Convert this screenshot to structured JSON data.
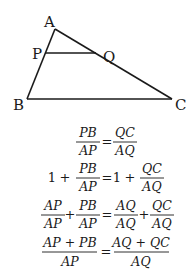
{
  "figure": {
    "vertices": {
      "A": {
        "label": "A",
        "x": 55,
        "y": 29
      },
      "B": {
        "label": "B",
        "x": 27,
        "y": 99
      },
      "C": {
        "label": "C",
        "x": 172,
        "y": 99
      },
      "P": {
        "label": "P",
        "x": 45,
        "y": 53
      },
      "Q": {
        "label": "Q",
        "x": 96,
        "y": 53
      }
    },
    "segments": [
      "AB",
      "AC",
      "BC",
      "PQ"
    ]
  },
  "equations": {
    "row1": {
      "lhs": {
        "num": "PB",
        "den": "AP"
      },
      "eq": "=",
      "rhs": {
        "num": "QC",
        "den": "AQ"
      }
    },
    "row2": {
      "lhs_const": "1",
      "lhs_plus": "+",
      "lhs": {
        "num": "PB",
        "den": "AP"
      },
      "eq": "=",
      "rhs_const": "1",
      "rhs_plus": "+",
      "rhs": {
        "num": "QC",
        "den": "AQ"
      }
    },
    "row3": {
      "lhs1": {
        "num": "AP",
        "den": "AP"
      },
      "lhs_plus": "+",
      "lhs2": {
        "num": "PB",
        "den": "AP"
      },
      "eq": "=",
      "rhs1": {
        "num": "AQ",
        "den": "AQ"
      },
      "rhs_plus": "+",
      "rhs2": {
        "num": "QC",
        "den": "AQ"
      }
    },
    "row4": {
      "lhs": {
        "num": "AP + PB",
        "den": "AP"
      },
      "eq": "=",
      "rhs": {
        "num": "AQ + QC",
        "den": "AQ"
      }
    }
  }
}
